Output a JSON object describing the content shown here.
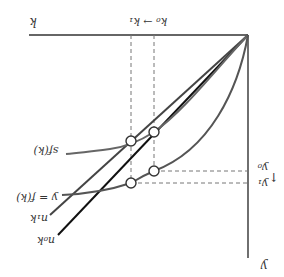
{
  "diagram": {
    "rotation_deg": 180,
    "axes": {
      "horizontal_label": "k",
      "vertical_label": "y"
    },
    "curves": [
      {
        "id": "production",
        "label": "y = f(k)",
        "color": "#555555"
      },
      {
        "id": "savings",
        "label": "sf(k)",
        "color": "#666666"
      },
      {
        "id": "break_even_0",
        "label": "n₀k",
        "color": "#111111"
      },
      {
        "id": "break_even_1",
        "label": "n₁k",
        "color": "#444444"
      }
    ],
    "k_markers": {
      "shift_label": "k₀ → k₁",
      "k0": "k₀",
      "k1": "k₁",
      "arrow": "→"
    },
    "y_markers": {
      "y0": "y₀",
      "y1": "y₁",
      "arrow": "↑"
    },
    "colors": {
      "axis": "#333333",
      "dashed": "#777777",
      "circle_fill": "#ffffff",
      "circle_stroke": "#333333"
    }
  }
}
